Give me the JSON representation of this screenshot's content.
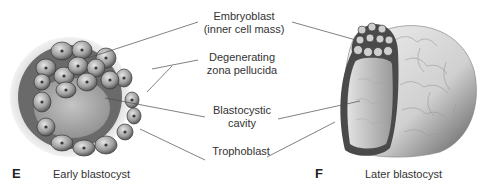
{
  "figure": {
    "panels": [
      {
        "letter": "E",
        "caption": "Early blastocyst"
      },
      {
        "letter": "F",
        "caption": "Later blastocyst"
      }
    ],
    "labels": [
      {
        "id": "embryoblast",
        "line1": "Embryoblast",
        "line2": "(inner cell mass)"
      },
      {
        "id": "zona",
        "line1": "Degenerating",
        "line2": "zona pellucida"
      },
      {
        "id": "cavity",
        "line1": "Blastocystic",
        "line2": "cavity"
      },
      {
        "id": "trophoblast",
        "line1": "Trophoblast"
      }
    ]
  }
}
